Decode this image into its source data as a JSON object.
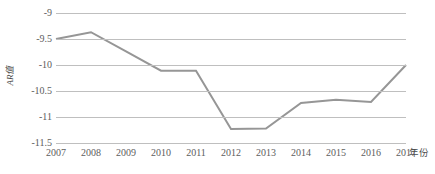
{
  "chart_data": {
    "type": "line",
    "title": "",
    "xlabel": "年份",
    "ylabel": "AR值",
    "categories": [
      "2007",
      "2008",
      "2009",
      "2010",
      "2011",
      "2012",
      "2013",
      "2014",
      "2015",
      "2016",
      "2017"
    ],
    "values": [
      -9.5,
      -9.37,
      -9.74,
      -10.11,
      -10.11,
      -11.23,
      -11.22,
      -10.73,
      -10.67,
      -10.71,
      -10.0
    ],
    "series": [
      {
        "name": "AR值",
        "values": [
          -9.5,
          -9.37,
          -9.74,
          -10.11,
          -10.11,
          -11.23,
          -11.22,
          -10.73,
          -10.67,
          -10.71,
          -10.0
        ]
      }
    ],
    "ylim": [
      -11.5,
      -9
    ],
    "ytick_labels": [
      "-9",
      "-9.5",
      "-10",
      "-10.5",
      "-11",
      "-11.5"
    ],
    "ytick_values": [
      -9,
      -9.5,
      -10,
      -10.5,
      -11,
      -11.5
    ],
    "xtick_labels": [
      "2007",
      "2008",
      "2009",
      "2010",
      "2011",
      "2012",
      "2013",
      "2014",
      "2015",
      "2016",
      "2017"
    ],
    "grid": true,
    "grid_axis": "y",
    "legend": false,
    "legend_position": "none",
    "line_color": "#969696",
    "grid_color": "#bfbfbf",
    "background_color": "#ffffff",
    "line_width": 2
  },
  "axes": {
    "y_title": "AR值",
    "x_title": "年份",
    "y_ticks": [
      {
        "label": "-9",
        "value": -9
      },
      {
        "label": "-9.5",
        "value": -9.5
      },
      {
        "label": "-10",
        "value": -10
      },
      {
        "label": "-10.5",
        "value": -10.5
      },
      {
        "label": "-11",
        "value": -11
      },
      {
        "label": "-11.5",
        "value": -11.5
      }
    ],
    "x_ticks": [
      {
        "label": "2007"
      },
      {
        "label": "2008"
      },
      {
        "label": "2009"
      },
      {
        "label": "2010"
      },
      {
        "label": "2011"
      },
      {
        "label": "2012"
      },
      {
        "label": "2013"
      },
      {
        "label": "2014"
      },
      {
        "label": "2015"
      },
      {
        "label": "2016"
      },
      {
        "label": "2017"
      }
    ]
  }
}
